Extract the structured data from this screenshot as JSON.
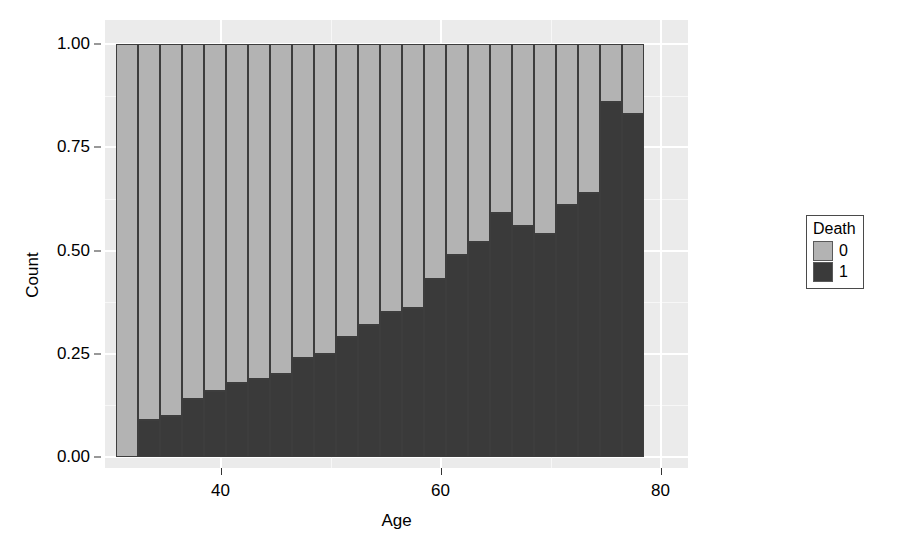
{
  "chart_data": {
    "type": "bar",
    "subtype": "stacked-proportion",
    "title": "",
    "xlabel": "Age",
    "ylabel": "Count",
    "xlim": [
      30.5,
      81.5
    ],
    "ylim": [
      0,
      1
    ],
    "grid": true,
    "legend": {
      "title": "Death",
      "position": "right",
      "entries": [
        {
          "label": "0",
          "color": "#b3b3b3"
        },
        {
          "label": "1",
          "color": "#3a3a3a"
        }
      ]
    },
    "x_ticks": [
      {
        "value": 40,
        "label": "40"
      },
      {
        "value": 60,
        "label": "60"
      },
      {
        "value": 80,
        "label": "80"
      }
    ],
    "y_ticks": [
      {
        "value": 0.0,
        "label": "0.00"
      },
      {
        "value": 0.25,
        "label": "0.25"
      },
      {
        "value": 0.5,
        "label": "0.50"
      },
      {
        "value": 0.75,
        "label": "0.75"
      },
      {
        "value": 1.0,
        "label": "1.00"
      }
    ],
    "x_minor_ticks": [
      50,
      70
    ],
    "y_minor_ticks": [
      0.125,
      0.375,
      0.625,
      0.875
    ],
    "bin_width": 2,
    "categories": [
      "31",
      "33",
      "35",
      "37",
      "39",
      "41",
      "43",
      "45",
      "47",
      "49",
      "51",
      "53",
      "55",
      "57",
      "59",
      "61",
      "63",
      "65",
      "67",
      "69",
      "71",
      "73",
      "75",
      "77"
    ],
    "bin_centers": [
      31.5,
      33.5,
      35.5,
      37.5,
      39.5,
      41.5,
      43.5,
      45.5,
      47.5,
      49.5,
      51.5,
      53.5,
      55.5,
      57.5,
      59.5,
      61.5,
      63.5,
      65.5,
      67.5,
      69.5,
      71.5,
      73.5,
      75.5,
      77.5
    ],
    "series": [
      {
        "name": "1",
        "legend_label": "1",
        "color": "#3a3a3a",
        "values": [
          0.0,
          0.09,
          0.1,
          0.14,
          0.16,
          0.18,
          0.19,
          0.2,
          0.24,
          0.25,
          0.29,
          0.32,
          0.35,
          0.36,
          0.43,
          0.49,
          0.52,
          0.59,
          0.56,
          0.54,
          0.61,
          0.64,
          0.86,
          0.83
        ]
      },
      {
        "name": "0",
        "legend_label": "0",
        "color": "#b3b3b3",
        "values": [
          1.0,
          0.91,
          0.9,
          0.86,
          0.84,
          0.82,
          0.81,
          0.8,
          0.76,
          0.75,
          0.71,
          0.68,
          0.65,
          0.64,
          0.57,
          0.51,
          0.48,
          0.41,
          0.44,
          0.46,
          0.39,
          0.36,
          0.14,
          0.17
        ]
      }
    ]
  },
  "axes": {
    "y_title": "Count",
    "x_title": "Age"
  },
  "style": {
    "panel_background": "#ebebeb",
    "grid_major_color": "#ffffff",
    "grid_minor_color": "#f7f7f7",
    "bar_outline": "#3d3d3d",
    "text_color": "#000000",
    "figure_background": "#ffffff"
  }
}
